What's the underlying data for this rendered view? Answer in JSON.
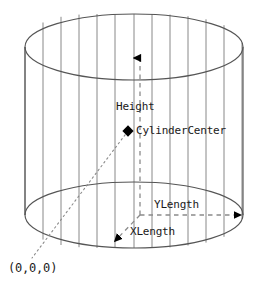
{
  "diagram": {
    "shape": "cylinder-wireframe",
    "labels": {
      "height": "Height",
      "cylinder_center": "CylinderCenter",
      "y_length": "YLength",
      "x_length": "XLength",
      "origin": "(0,0,0)"
    },
    "markers": {
      "cylinder_center_marker": "diamond-marker",
      "height_arrow": "arrow-up",
      "ylength_arrow": "arrow-right",
      "xlength_arrow": "arrow-down-left",
      "origin_leader": "dotted-leader-line"
    },
    "colors": {
      "outline": "#555555",
      "mesh": "#777777",
      "axis": "#888888",
      "text": "#1a1a1a",
      "marker": "#000000",
      "background": "#ffffff"
    },
    "geometry": {
      "top_ellipse_center_x": 134,
      "top_ellipse_center_y": 47,
      "bottom_ellipse_center_x": 134,
      "bottom_ellipse_center_y": 215,
      "ellipse_radius_x": 109,
      "ellipse_radius_y": 33,
      "mesh_line_count": 13
    }
  }
}
